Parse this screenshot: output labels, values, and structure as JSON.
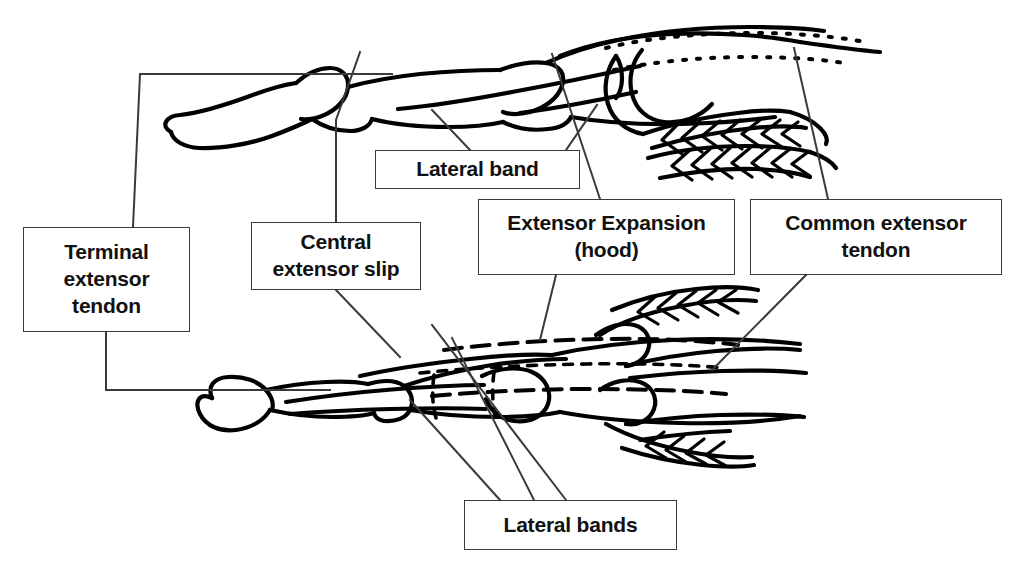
{
  "figure": {
    "kind": "anatomical-line-diagram",
    "background_color": "#ffffff",
    "ink_color": "#000000",
    "box_border_color": "#3a3a3a",
    "leader_line_color": "#3a3a3a"
  },
  "labels": {
    "terminal_extensor_tendon": "Terminal\nextensor\ntendon",
    "central_extensor_slip": "Central\nextensor slip",
    "lateral_band": "Lateral band",
    "extensor_expansion_hood": "Extensor Expansion\n(hood)",
    "common_extensor_tendon": "Common extensor\ntendon",
    "lateral_bands": "Lateral bands"
  },
  "views": {
    "top": "lateral view of finger",
    "bottom": "dorsal view of finger"
  }
}
